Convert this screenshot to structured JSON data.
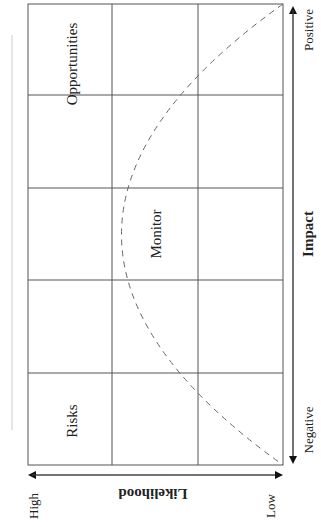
{
  "diagram": {
    "type": "risk-opportunity matrix (rotated 90°)",
    "grid": {
      "rows": 5,
      "cols": 3
    },
    "cells": {
      "opportunities": "Opportunities",
      "monitor": "Monitor",
      "risks": "Risks"
    },
    "axes": {
      "impact": {
        "title": "Impact",
        "positive": "Positive",
        "negative": "Negative"
      },
      "likelihood": {
        "title": "Likelihood",
        "high": "High",
        "low": "Low"
      }
    },
    "colors": {
      "grid": "#555555",
      "curve": "#666666",
      "text": "#222222",
      "side_rule": "#cccccc"
    }
  }
}
